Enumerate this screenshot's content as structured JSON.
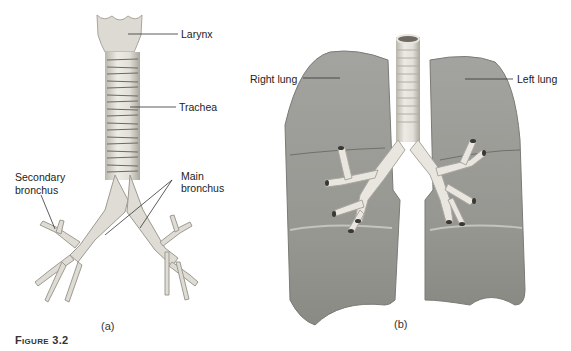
{
  "figure": {
    "number_label": "Figure 3.2",
    "panel_a": {
      "caption": "(a)",
      "labels": {
        "larynx": "Larynx",
        "trachea": "Trachea",
        "secondary_bronchus_line1": "Secondary",
        "secondary_bronchus_line2": "bronchus",
        "main_bronchus_line1": "Main",
        "main_bronchus_line2": "bronchus"
      }
    },
    "panel_b": {
      "caption": "(b)",
      "labels": {
        "right_lung": "Right lung",
        "left_lung": "Left lung"
      }
    }
  },
  "colors": {
    "lung_gray": "#9a9a96",
    "airway_light": "#e6e4dc",
    "ring_dark": "#6e6a62",
    "text": "#222222"
  }
}
